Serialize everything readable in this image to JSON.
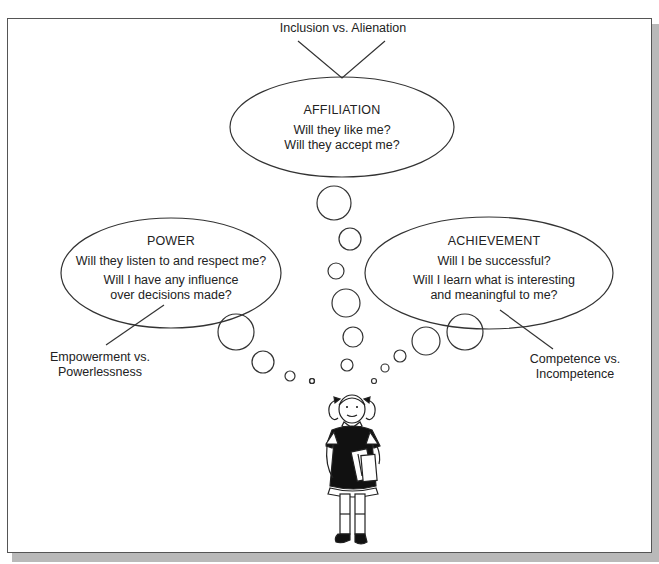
{
  "diagram": {
    "top_label": "Inclusion vs. Alienation",
    "affiliation": {
      "title": "AFFILIATION",
      "questions": [
        "Will they like me?",
        "Will they accept me?"
      ]
    },
    "power": {
      "title": "POWER",
      "questions": [
        "Will they listen to and respect me?",
        "Will I have any influence",
        "over decisions made?"
      ]
    },
    "achievement": {
      "title": "ACHIEVEMENT",
      "questions": [
        "Will I be successful?",
        "Will I learn what is interesting",
        "and meaningful to me?"
      ]
    },
    "left_label": [
      "Empowerment vs.",
      "Powerlessness"
    ],
    "right_label": [
      "Competence vs.",
      "Incompetence"
    ],
    "figure": "girl-with-books-illustration",
    "colors": {
      "stroke": "#333333",
      "shadow": "#b9b9b9",
      "background": "#ffffff"
    }
  }
}
